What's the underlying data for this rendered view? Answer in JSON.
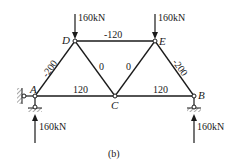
{
  "diagram": {
    "type": "truss",
    "caption": "(b)",
    "nodes": {
      "A": {
        "label": "A",
        "x": 35,
        "y": 96
      },
      "C": {
        "label": "C",
        "x": 115,
        "y": 96
      },
      "B": {
        "label": "B",
        "x": 194,
        "y": 96
      },
      "D": {
        "label": "D",
        "x": 75,
        "y": 41
      },
      "E": {
        "label": "E",
        "x": 155,
        "y": 41
      }
    },
    "members": [
      {
        "from": "A",
        "to": "D",
        "force": "-200"
      },
      {
        "from": "D",
        "to": "E",
        "force": "-120"
      },
      {
        "from": "E",
        "to": "B",
        "force": "-200"
      },
      {
        "from": "D",
        "to": "C",
        "force": "0"
      },
      {
        "from": "E",
        "to": "C",
        "force": "0"
      },
      {
        "from": "A",
        "to": "C",
        "force": "120"
      },
      {
        "from": "C",
        "to": "B",
        "force": "120"
      }
    ],
    "loads": [
      {
        "node": "D",
        "label": "160kN",
        "direction": "down"
      },
      {
        "node": "E",
        "label": "160kN",
        "direction": "down"
      }
    ],
    "reactions": [
      {
        "node": "A",
        "label": "160kN",
        "direction": "up"
      },
      {
        "node": "B",
        "label": "160kN",
        "direction": "up"
      }
    ],
    "colors": {
      "line": "#1a1a1a",
      "hatch": "#555555"
    }
  }
}
